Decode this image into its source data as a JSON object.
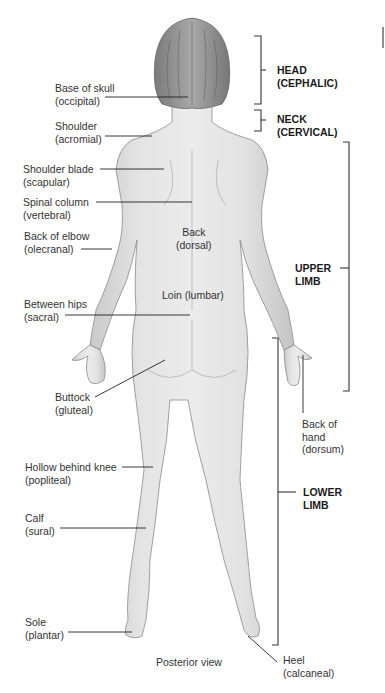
{
  "figure": {
    "view_caption": "Posterior view",
    "regions": {
      "head": [
        "HEAD",
        "(CEPHALIC)"
      ],
      "neck": [
        "NECK",
        "(CERVICAL)"
      ],
      "upper_limb": [
        "UPPER",
        "LIMB"
      ],
      "lower_limb": [
        "LOWER",
        "LIMB"
      ]
    },
    "labels": {
      "base_of_skull": [
        "Base of skull",
        "(occipital)"
      ],
      "shoulder": [
        "Shoulder",
        "(acromial)"
      ],
      "shoulder_blade": [
        "Shoulder blade",
        "(scapular)"
      ],
      "spinal_column": [
        "Spinal column",
        "(vertebral)"
      ],
      "back_of_elbow": [
        "Back of elbow",
        "(olecranal)"
      ],
      "back": [
        "Back",
        "(dorsal)"
      ],
      "loin": "Loin (lumbar)",
      "between_hips": [
        "Between hips",
        "(sacral)"
      ],
      "buttock": [
        "Buttock",
        "(gluteal)"
      ],
      "back_of_hand": [
        "Back of",
        "hand",
        "(dorsum)"
      ],
      "hollow_behind_knee": [
        "Hollow behind knee",
        "(popliteal)"
      ],
      "calf": [
        "Calf",
        "(sural)"
      ],
      "sole": [
        "Sole",
        "(plantar)"
      ],
      "heel": [
        "Heel",
        "(calcaneal)"
      ]
    }
  }
}
